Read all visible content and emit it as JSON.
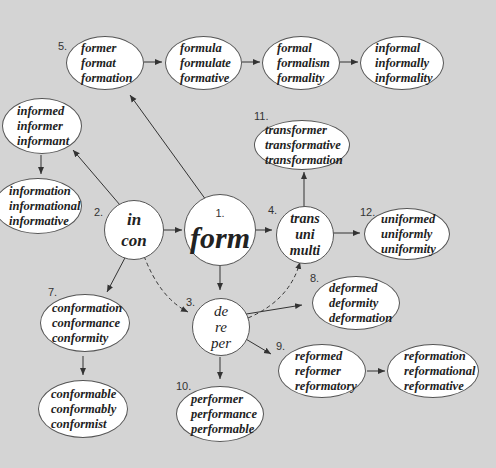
{
  "diagram": {
    "center": {
      "number": "1.",
      "label": "form"
    },
    "prefix_nodes": [
      {
        "id": "p2",
        "number": "2.",
        "lines": [
          "in",
          "con"
        ]
      },
      {
        "id": "p3",
        "number": "3.",
        "lines": [
          "de",
          "re",
          "per"
        ]
      },
      {
        "id": "p4",
        "number": "4.",
        "lines": [
          "trans",
          "uni",
          "multi"
        ]
      }
    ],
    "word_nodes": [
      {
        "id": "n5",
        "number": "5.",
        "words": [
          "former",
          "format",
          "formation"
        ]
      },
      {
        "id": "n5b",
        "number": "",
        "words": [
          "formula",
          "formulate",
          "formative"
        ]
      },
      {
        "id": "n5c",
        "number": "",
        "words": [
          "formal",
          "formalism",
          "formality"
        ]
      },
      {
        "id": "n5d",
        "number": "",
        "words": [
          "informal",
          "informally",
          "informality"
        ]
      },
      {
        "id": "n6",
        "number": "",
        "words": [
          "informed",
          "informer",
          "informant"
        ]
      },
      {
        "id": "n6b",
        "number": "",
        "words": [
          "information",
          "informational",
          "informative"
        ]
      },
      {
        "id": "n7",
        "number": "7.",
        "words": [
          "conformation",
          "conformance",
          "conformity"
        ]
      },
      {
        "id": "n7b",
        "number": "",
        "words": [
          "conformable",
          "conformably",
          "conformist"
        ]
      },
      {
        "id": "n8",
        "number": "8.",
        "words": [
          "deformed",
          "deformity",
          "deformation"
        ]
      },
      {
        "id": "n9",
        "number": "9.",
        "words": [
          "reformed",
          "reformer",
          "reformatory"
        ]
      },
      {
        "id": "n9b",
        "number": "",
        "words": [
          "reformation",
          "reformational",
          "reformative"
        ]
      },
      {
        "id": "n10",
        "number": "10.",
        "words": [
          "performer",
          "performance",
          "performable"
        ]
      },
      {
        "id": "n11",
        "number": "11.",
        "words": [
          "transformer",
          "transformative",
          "transformation"
        ]
      },
      {
        "id": "n12",
        "number": "12.",
        "words": [
          "uniformed",
          "uniformly",
          "uniformity"
        ]
      }
    ],
    "colors": {
      "background": "#d4d4d4",
      "node_fill": "#ffffff",
      "stroke": "#444444"
    }
  }
}
